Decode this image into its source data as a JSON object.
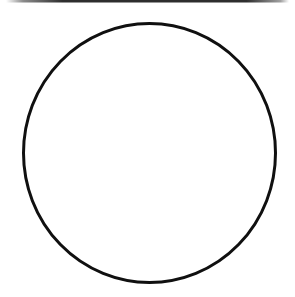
{
  "canvas": {
    "width": 295,
    "height": 297,
    "background_color": "#ffffff"
  },
  "top_scan_line": {
    "x": 6,
    "y": 0,
    "width": 283,
    "height": 2.5,
    "color": "#2e2e2e"
  },
  "circle": {
    "cx": 149.5,
    "cy": 153,
    "rx": 126,
    "ry": 129.5,
    "stroke_color": "#101010",
    "stroke_width": 3,
    "fill": "none"
  }
}
